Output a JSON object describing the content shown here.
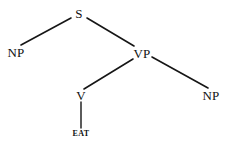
{
  "figure": {
    "type": "constituency-syntax-tree",
    "background_color": "#ffffff",
    "line_color": "#161616",
    "text_color": "#111111",
    "width": 228,
    "height": 154
  },
  "nodes": [
    {
      "id": "S",
      "label": "S",
      "kind": "nonterminal",
      "x": 79,
      "y": 13
    },
    {
      "id": "NP1",
      "label": "NP",
      "kind": "nonterminal",
      "x": 16,
      "y": 52
    },
    {
      "id": "VP",
      "label": "VP",
      "kind": "nonterminal",
      "x": 142,
      "y": 53
    },
    {
      "id": "V",
      "label": "V",
      "kind": "nonterminal",
      "x": 81,
      "y": 95
    },
    {
      "id": "NP2",
      "label": "NP",
      "kind": "nonterminal",
      "x": 211,
      "y": 95
    },
    {
      "id": "EAT",
      "label": "EAT",
      "kind": "terminal",
      "x": 81,
      "y": 134
    }
  ],
  "edges": [
    {
      "from": "S",
      "to": "NP1",
      "x1": 71,
      "y1": 18,
      "x2": 21,
      "y2": 45
    },
    {
      "from": "S",
      "to": "VP",
      "x1": 87,
      "y1": 18,
      "x2": 134,
      "y2": 46
    },
    {
      "from": "VP",
      "to": "V",
      "x1": 133,
      "y1": 59,
      "x2": 84,
      "y2": 89
    },
    {
      "from": "VP",
      "to": "NP2",
      "x1": 152,
      "y1": 57,
      "x2": 208,
      "y2": 88
    },
    {
      "from": "V",
      "to": "EAT",
      "x1": 81,
      "y1": 102,
      "x2": 81,
      "y2": 128
    }
  ]
}
